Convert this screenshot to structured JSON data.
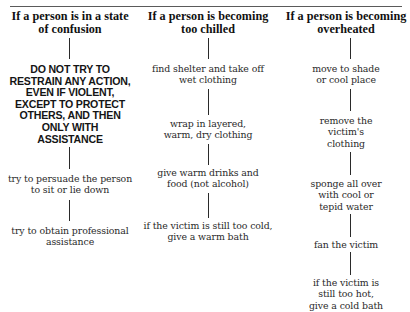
{
  "document": {
    "columns": [
      {
        "header": "If a person is in a state of confusion",
        "header_lines": [
          "If a person is in a state",
          "of confusion"
        ],
        "warning": {
          "lines": [
            "DO NOT TRY TO",
            "RESTRAIN ANY ACTION,",
            "EVEN IF VIOLENT,",
            "EXCEPT TO PROTECT",
            "OTHERS, AND THEN",
            "ONLY WITH",
            "ASSISTANCE"
          ]
        },
        "steps": [
          {
            "lines": [
              "try to persuade the person",
              "to sit or lie down"
            ]
          },
          {
            "lines": [
              "try to obtain professional",
              "assistance"
            ]
          }
        ]
      },
      {
        "header": "If a person is becoming too chilled",
        "header_lines": [
          "If a person is becoming",
          "too chilled"
        ],
        "steps": [
          {
            "lines": [
              "find shelter and take off",
              "wet clothing"
            ]
          },
          {
            "lines": [
              "wrap in layered,",
              "warm, dry clothing"
            ]
          },
          {
            "lines": [
              "give warm drinks and",
              "food (not alcohol)"
            ]
          },
          {
            "lines": [
              "if the victim is still too cold,",
              "give a warm bath"
            ]
          }
        ]
      },
      {
        "header": "If a person is becoming overheated",
        "header_lines": [
          "If a person is becoming",
          "overheated"
        ],
        "steps": [
          {
            "lines": [
              "move to shade",
              "or cool place"
            ]
          },
          {
            "lines": [
              "remove the",
              "victim's",
              "clothing"
            ]
          },
          {
            "lines": [
              "sponge all over",
              "with cool or",
              "tepid water"
            ]
          },
          {
            "lines": [
              "fan the victim"
            ]
          },
          {
            "lines": [
              "if the victim is",
              "still too hot,",
              "give a cold bath"
            ]
          }
        ]
      }
    ]
  }
}
